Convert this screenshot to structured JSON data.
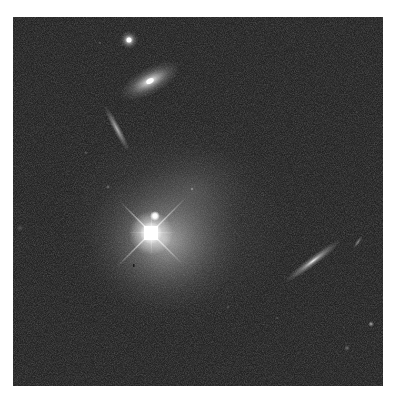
{
  "image": {
    "kind": "astronomical-deep-field",
    "description": "Grayscale space telescope image of a bright quasar with a diffuse host galaxy halo and several surrounding galaxies",
    "background_color": "#2c2c2c",
    "page_background": "#ffffff",
    "frame": {
      "x": 13,
      "y": 17,
      "width": 370,
      "height": 369
    }
  },
  "objects": [
    {
      "name": "quasar-core",
      "type": "point-source",
      "x": 151,
      "y": 233,
      "brightness": 1.0,
      "note": "saturated with diffraction spikes"
    },
    {
      "name": "companion-knot",
      "type": "point-source",
      "x": 155,
      "y": 216,
      "brightness": 0.85
    },
    {
      "name": "host-halo",
      "type": "diffuse",
      "x": 165,
      "y": 240,
      "rx": 75,
      "ry": 70
    },
    {
      "name": "round-galaxy-top",
      "type": "compact-galaxy",
      "x": 129,
      "y": 40
    },
    {
      "name": "elliptical-galaxy",
      "type": "elliptical",
      "x": 150,
      "y": 81,
      "rx": 30,
      "ry": 12,
      "angle": -30
    },
    {
      "name": "edge-on-galaxy-left",
      "type": "edge-on",
      "x": 117,
      "y": 129,
      "length": 48,
      "angle": 62
    },
    {
      "name": "edge-on-galaxy-right",
      "type": "edge-on",
      "x": 313,
      "y": 261,
      "length": 68,
      "angle": -37
    },
    {
      "name": "small-streak-right",
      "type": "edge-on",
      "x": 358,
      "y": 242,
      "length": 14,
      "angle": -55
    },
    {
      "name": "small-star-right",
      "type": "point-source",
      "x": 371,
      "y": 324
    },
    {
      "name": "faint-blob-lower-right",
      "type": "faint",
      "x": 347,
      "y": 348
    },
    {
      "name": "faint-dot-center",
      "type": "faint",
      "x": 192,
      "y": 189
    },
    {
      "name": "faint-dot-left",
      "type": "faint",
      "x": 108,
      "y": 187
    },
    {
      "name": "dark-speck",
      "type": "artifact",
      "x": 133,
      "y": 265
    }
  ],
  "caption": "Quasar host galaxy field"
}
